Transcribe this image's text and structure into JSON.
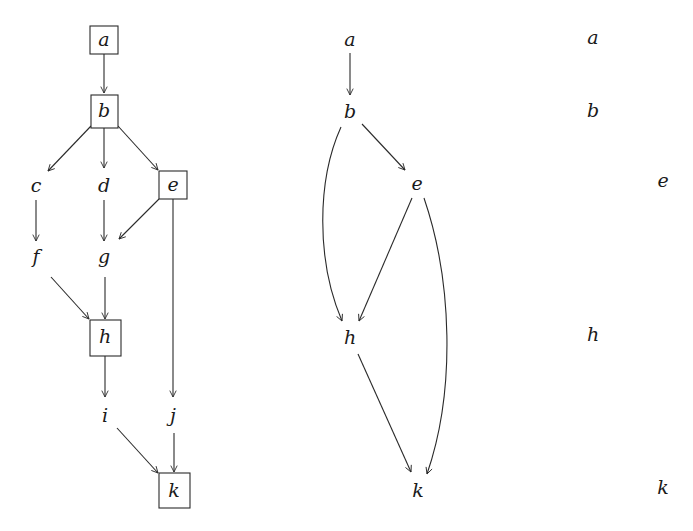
{
  "colors": {
    "stroke": "#2a2a2a",
    "text": "#1a1a1a",
    "background": "#ffffff"
  },
  "full_graph": {
    "nodes": [
      {
        "id": "a",
        "label": "a",
        "x": 104,
        "y": 40,
        "boxed": true
      },
      {
        "id": "b",
        "label": "b",
        "x": 104,
        "y": 111,
        "boxed": true
      },
      {
        "id": "c",
        "label": "c",
        "x": 36,
        "y": 186,
        "boxed": false
      },
      {
        "id": "d",
        "label": "d",
        "x": 104,
        "y": 186,
        "boxed": false
      },
      {
        "id": "e",
        "label": "e",
        "x": 173,
        "y": 185,
        "boxed": true
      },
      {
        "id": "f",
        "label": "f",
        "x": 36,
        "y": 257,
        "boxed": false
      },
      {
        "id": "g",
        "label": "g",
        "x": 104,
        "y": 257,
        "boxed": false
      },
      {
        "id": "h",
        "label": "h",
        "x": 105,
        "y": 337,
        "boxed": true
      },
      {
        "id": "i",
        "label": "i",
        "x": 105,
        "y": 416,
        "boxed": false
      },
      {
        "id": "j",
        "label": "j",
        "x": 173,
        "y": 416,
        "boxed": false
      },
      {
        "id": "k",
        "label": "k",
        "x": 174,
        "y": 491,
        "boxed": true
      }
    ],
    "edges": [
      [
        "a",
        "b"
      ],
      [
        "b",
        "c"
      ],
      [
        "b",
        "d"
      ],
      [
        "b",
        "e"
      ],
      [
        "c",
        "f"
      ],
      [
        "d",
        "g"
      ],
      [
        "e",
        "g"
      ],
      [
        "f",
        "h"
      ],
      [
        "g",
        "h"
      ],
      [
        "e",
        "j"
      ],
      [
        "h",
        "i"
      ],
      [
        "i",
        "k"
      ],
      [
        "j",
        "k"
      ]
    ]
  },
  "reduced_graph": {
    "nodes": [
      {
        "id": "a",
        "label": "a",
        "x": 350,
        "y": 40
      },
      {
        "id": "b",
        "label": "b",
        "x": 350,
        "y": 112
      },
      {
        "id": "e",
        "label": "e",
        "x": 417,
        "y": 184
      },
      {
        "id": "h",
        "label": "h",
        "x": 350,
        "y": 338
      },
      {
        "id": "k",
        "label": "k",
        "x": 418,
        "y": 491
      }
    ],
    "edges": [
      [
        "a",
        "b",
        "straight"
      ],
      [
        "b",
        "e",
        "straight"
      ],
      [
        "b",
        "h",
        "curved"
      ],
      [
        "e",
        "h",
        "straight"
      ],
      [
        "e",
        "k",
        "curved"
      ],
      [
        "h",
        "k",
        "straight"
      ]
    ]
  },
  "levels_column": {
    "nodes": [
      {
        "id": "a",
        "label": "a",
        "x": 593,
        "y": 38
      },
      {
        "id": "b",
        "label": "b",
        "x": 593,
        "y": 111
      },
      {
        "id": "e",
        "label": "e",
        "x": 663,
        "y": 181
      },
      {
        "id": "h",
        "label": "h",
        "x": 593,
        "y": 335
      },
      {
        "id": "k",
        "label": "k",
        "x": 663,
        "y": 488
      }
    ]
  }
}
